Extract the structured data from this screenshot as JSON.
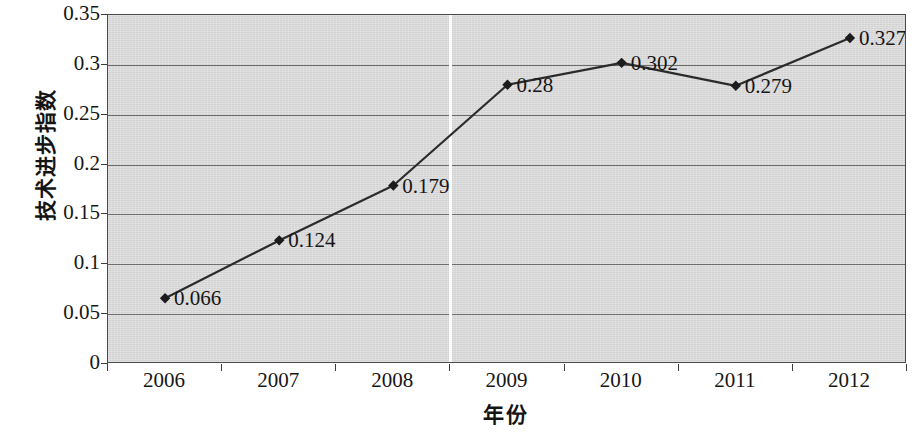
{
  "chart_data": {
    "type": "line",
    "title": "",
    "xlabel": "年份",
    "ylabel": "技术进步指数",
    "categories": [
      "2006",
      "2007",
      "2008",
      "2009",
      "2010",
      "2011",
      "2012"
    ],
    "values": [
      0.066,
      0.124,
      0.179,
      0.28,
      0.302,
      0.279,
      0.327
    ],
    "point_labels": [
      "0.066",
      "0.124",
      "0.179",
      "0.28",
      "0.302",
      "0.279",
      "0.327"
    ],
    "ylim": [
      0,
      0.35
    ],
    "y_ticks": [
      0,
      0.05,
      0.1,
      0.15,
      0.2,
      0.25,
      0.3,
      0.35
    ],
    "y_tick_labels": [
      "0",
      "0.05",
      "0.1",
      "0.15",
      "0.2",
      "0.25",
      "0.3",
      "0.35"
    ],
    "grid": true,
    "legend": "none",
    "marker": "diamond",
    "line_color": "#2b2b2b",
    "marker_color": "#1c1c1c",
    "plot_background": "#d9d9d9",
    "gridline_color": "#6d6d6d",
    "annotations": [
      {
        "name": "period-divider",
        "kind": "vertical-line",
        "between": [
          "2008",
          "2009"
        ],
        "color": "#fdfdfd"
      }
    ]
  }
}
